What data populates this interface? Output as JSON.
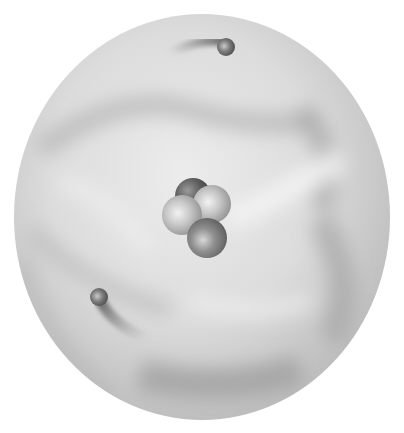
{
  "illustration": {
    "subject": "atom",
    "colors": {
      "background": "#ffffff",
      "cloud_light": "#e6e6e6",
      "cloud_mid": "#cfcfcf",
      "cloud_dark": "#a9a9a9",
      "particle_dark": "#5a5a5a",
      "particle_light": "#b8b8b8"
    },
    "electron_cloud": {
      "cx": 202,
      "cy": 217,
      "rx": 188,
      "ry": 203
    },
    "nucleus": {
      "particles": [
        {
          "role": "back",
          "cx": 193,
          "cy": 196,
          "r": 18,
          "shade": "dark"
        },
        {
          "role": "right",
          "cx": 212,
          "cy": 204,
          "r": 19,
          "shade": "light"
        },
        {
          "role": "left",
          "cx": 182,
          "cy": 215,
          "r": 20,
          "shade": "light"
        },
        {
          "role": "front",
          "cx": 207,
          "cy": 238,
          "r": 20,
          "shade": "mid"
        }
      ]
    },
    "electrons": [
      {
        "position": "top",
        "cx": 226,
        "cy": 47,
        "r": 9
      },
      {
        "position": "bottom-left",
        "cx": 99,
        "cy": 297,
        "r": 9
      }
    ]
  }
}
